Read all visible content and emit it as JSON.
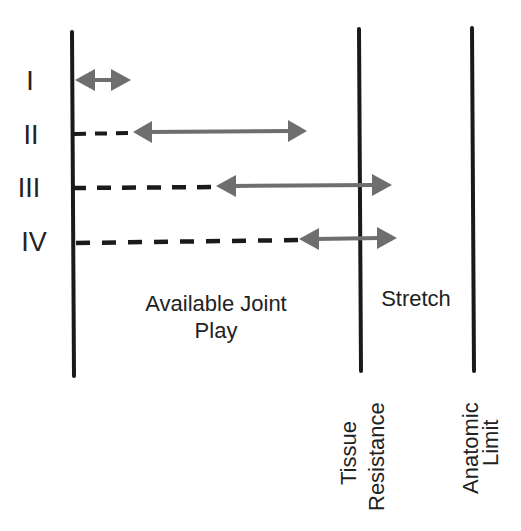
{
  "diagram": {
    "grades": [
      {
        "label": "I",
        "y": 80,
        "dash_to": null,
        "arrow_from": 75,
        "arrow_to": 131
      },
      {
        "label": "II",
        "y": 132,
        "dash_to": 128,
        "arrow_from": 133,
        "arrow_to": 307
      },
      {
        "label": "III",
        "y": 186,
        "dash_to": 215,
        "arrow_from": 216,
        "arrow_to": 392
      },
      {
        "label": "IV",
        "y": 239,
        "dash_to": 300,
        "arrow_from": 299,
        "arrow_to": 397
      }
    ],
    "regions": {
      "joint_play_line1": "Available Joint",
      "joint_play_line2": "Play",
      "stretch": "Stretch"
    },
    "barriers": {
      "tissue_line1": "Tissue",
      "tissue_line2": "Resistance",
      "anatomic_line1": "Anatomic",
      "anatomic_line2": "Limit"
    },
    "colors": {
      "line": "#1a1a1a",
      "arrow": "#6e6e6e",
      "text": "#222222"
    }
  }
}
